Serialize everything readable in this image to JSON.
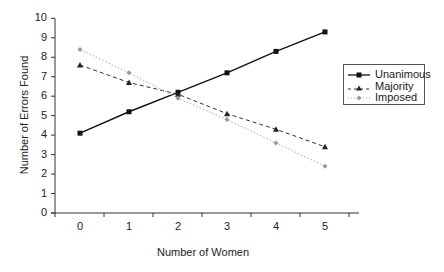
{
  "chart_data": {
    "type": "line",
    "title": "",
    "xlabel": "Number of Women",
    "ylabel": "Number of Errors Found",
    "x": [
      0,
      1,
      2,
      3,
      4,
      5
    ],
    "ylim": [
      0,
      10
    ],
    "yticks": [
      0,
      1,
      2,
      3,
      4,
      5,
      6,
      7,
      8,
      9,
      10
    ],
    "grid": false,
    "legend_position": "right",
    "series": [
      {
        "name": "Unanimous",
        "style": "solid",
        "marker": "square",
        "color": "#111111",
        "values": [
          4.1,
          5.2,
          6.2,
          7.2,
          8.3,
          9.3
        ]
      },
      {
        "name": "Majority",
        "style": "dashed",
        "marker": "triangle",
        "color": "#333333",
        "values": [
          7.6,
          6.7,
          6.1,
          5.1,
          4.3,
          3.4
        ]
      },
      {
        "name": "Imposed",
        "style": "dotted",
        "marker": "diamond",
        "color": "#999999",
        "values": [
          8.4,
          7.2,
          5.9,
          4.8,
          3.6,
          2.4
        ]
      }
    ]
  },
  "legend": {
    "items": [
      {
        "label": "Unanimous"
      },
      {
        "label": "Majority"
      },
      {
        "label": "Imposed"
      }
    ]
  }
}
